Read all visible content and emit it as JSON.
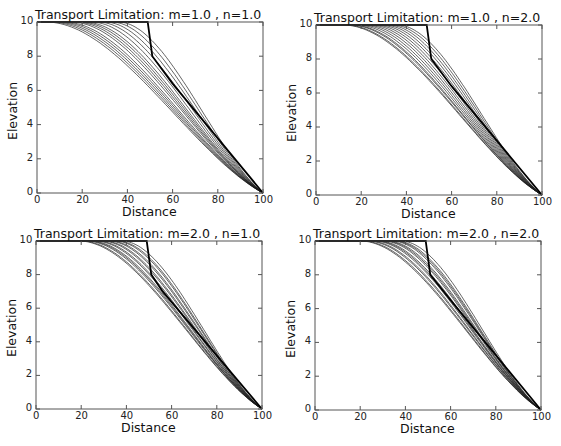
{
  "chart_data": [
    {
      "type": "line",
      "title": "Transport Limitation: m=1.0 , n=1.0",
      "xlabel": "Distance",
      "ylabel": "Elevation",
      "xlim": [
        0,
        100
      ],
      "ylim": [
        0,
        10
      ],
      "xticks": [
        "0",
        "20",
        "40",
        "60",
        "80",
        "100"
      ],
      "yticks": [
        "0",
        "2",
        "4",
        "6",
        "8",
        "10"
      ],
      "grid": false,
      "legend": null,
      "initial_profile": {
        "x": [
          0,
          49,
          51,
          60,
          100
        ],
        "y": [
          10,
          10,
          8,
          6.4,
          0
        ]
      },
      "evolved_profiles": {
        "count": 14,
        "onset_x_range": [
          2,
          36
        ],
        "converge_x": 100,
        "converge_y": 0
      },
      "plateau_onset_x": [
        36,
        33,
        30,
        27,
        24,
        21,
        19,
        17,
        15,
        12,
        10,
        8,
        6,
        4
      ]
    },
    {
      "type": "line",
      "title": "Transport Limitation: m=1.0 , n=2.0",
      "xlabel": "Distance",
      "ylabel": "Elevation",
      "xlim": [
        0,
        100
      ],
      "ylim": [
        0,
        10
      ],
      "xticks": [
        "0",
        "20",
        "40",
        "60",
        "80",
        "100"
      ],
      "yticks": [
        "0",
        "2",
        "4",
        "6",
        "8",
        "10"
      ],
      "grid": false,
      "legend": null,
      "initial_profile": {
        "x": [
          0,
          49,
          51,
          60,
          100
        ],
        "y": [
          10,
          10,
          8,
          6.4,
          0
        ]
      },
      "evolved_profiles": {
        "count": 14,
        "onset_x_range": [
          12,
          36
        ],
        "converge_x": 100,
        "converge_y": 0
      },
      "plateau_onset_x": [
        36,
        34,
        32,
        30,
        28,
        26,
        24,
        22,
        20,
        18,
        16,
        15,
        13,
        12
      ]
    },
    {
      "type": "line",
      "title": "Transport Limitation: m=2.0 , n=1.0",
      "xlabel": "Distance",
      "ylabel": "Elevation",
      "xlim": [
        0,
        100
      ],
      "ylim": [
        0,
        10
      ],
      "xticks": [
        "0",
        "20",
        "40",
        "60",
        "80",
        "100"
      ],
      "yticks": [
        "0",
        "2",
        "4",
        "6",
        "8",
        "10"
      ],
      "grid": false,
      "legend": null,
      "initial_profile": {
        "x": [
          0,
          49,
          51,
          56,
          100
        ],
        "y": [
          10,
          10,
          8,
          7,
          0
        ]
      },
      "evolved_profiles": {
        "count": 14,
        "onset_x_range": [
          19,
          38
        ],
        "converge_x": 100,
        "converge_y": 0
      },
      "plateau_onset_x": [
        38,
        36,
        35,
        33,
        32,
        30,
        29,
        27,
        26,
        24,
        23,
        22,
        20,
        19
      ]
    },
    {
      "type": "line",
      "title": "Transport Limitation: m=2.0 , n=2.0",
      "xlabel": "Distance",
      "ylabel": "Elevation",
      "xlim": [
        0,
        100
      ],
      "ylim": [
        0,
        10
      ],
      "xticks": [
        "0",
        "20",
        "40",
        "60",
        "80",
        "100"
      ],
      "yticks": [
        "0",
        "2",
        "4",
        "6",
        "8",
        "10"
      ],
      "grid": false,
      "legend": null,
      "initial_profile": {
        "x": [
          0,
          49,
          51,
          60,
          100
        ],
        "y": [
          10,
          10,
          8,
          6.5,
          0
        ]
      },
      "evolved_profiles": {
        "count": 14,
        "onset_x_range": [
          20,
          38
        ],
        "converge_x": 100,
        "converge_y": 0
      },
      "plateau_onset_x": [
        38,
        36,
        35,
        34,
        32,
        31,
        30,
        28,
        27,
        26,
        24,
        23,
        21,
        20
      ]
    }
  ],
  "panels": [
    {
      "title": "Transport Limitation: m=1.0 , n=1.0",
      "xlabel": "Distance",
      "ylabel": "Elevation"
    },
    {
      "title": "Transport Limitation: m=1.0 , n=2.0",
      "xlabel": "Distance",
      "ylabel": "Elevation"
    },
    {
      "title": "Transport Limitation: m=2.0 , n=1.0",
      "xlabel": "Distance",
      "ylabel": "Elevation"
    },
    {
      "title": "Transport Limitation: m=2.0 , n=2.0",
      "xlabel": "Distance",
      "ylabel": "Elevation"
    }
  ],
  "colors": {
    "initial_line": "#000000",
    "evolved_lines": "#1a1a1a",
    "axes": "#555555"
  }
}
